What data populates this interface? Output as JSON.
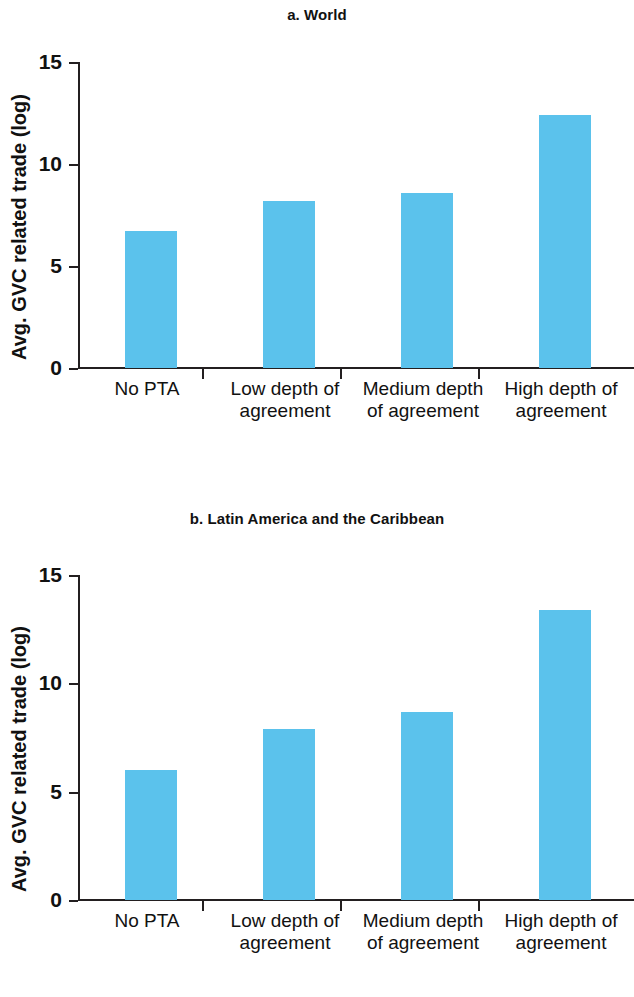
{
  "figure": {
    "background": "#ffffff",
    "bar_color": "#5BC2EC",
    "axis_color": "#231f20"
  },
  "panels": [
    {
      "id": "a",
      "title": "a. World",
      "ylabel": "Avg. GVC related trade (log)",
      "yticks": [
        "0",
        "5",
        "10",
        "15"
      ],
      "categories": [
        "No PTA",
        "Low depth of agreement",
        "Medium depth of agreement",
        "High depth of agreement"
      ]
    },
    {
      "id": "b",
      "title": "b. Latin America and the Caribbean",
      "ylabel": "Avg. GVC related trade (log)",
      "yticks": [
        "0",
        "5",
        "10",
        "15"
      ],
      "categories": [
        "No PTA",
        "Low depth of agreement",
        "Medium depth of agreement",
        "High depth of agreement"
      ]
    }
  ],
  "chart_data": [
    {
      "type": "bar",
      "title": "a. World",
      "xlabel": "",
      "ylabel": "Avg. GVC related trade (log)",
      "categories": [
        "No PTA",
        "Low depth of agreement",
        "Medium depth of agreement",
        "High depth of agreement"
      ],
      "values": [
        6.7,
        8.2,
        8.6,
        12.4
      ],
      "ylim": [
        0,
        15
      ],
      "yticks": [
        0,
        5,
        10,
        15
      ],
      "grid": false,
      "legend": "none",
      "series_color": "#5BC2EC"
    },
    {
      "type": "bar",
      "title": "b. Latin America and the Caribbean",
      "xlabel": "",
      "ylabel": "Avg. GVC related trade (log)",
      "categories": [
        "No PTA",
        "Low depth of agreement",
        "Medium depth of agreement",
        "High depth of agreement"
      ],
      "values": [
        6.0,
        7.9,
        8.7,
        13.4
      ],
      "ylim": [
        0,
        15
      ],
      "yticks": [
        0,
        5,
        10,
        15
      ],
      "grid": false,
      "legend": "none",
      "series_color": "#5BC2EC"
    }
  ]
}
